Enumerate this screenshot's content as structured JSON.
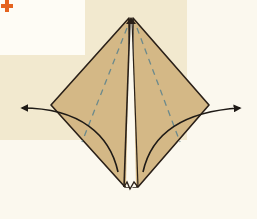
{
  "diagram": {
    "type": "origami-step",
    "step_marker": {
      "symbol": "+",
      "color": "#e5631e"
    },
    "colors": {
      "paper": "#d4b886",
      "outline": "#2a2018",
      "dashed_fold": "#6c8a8c",
      "background": "#fbf8ee",
      "band": "#f2e9cf"
    },
    "arrows": [
      {
        "direction": "left",
        "label": "fold-left-flap-out"
      },
      {
        "direction": "right",
        "label": "fold-right-flap-out"
      }
    ]
  }
}
